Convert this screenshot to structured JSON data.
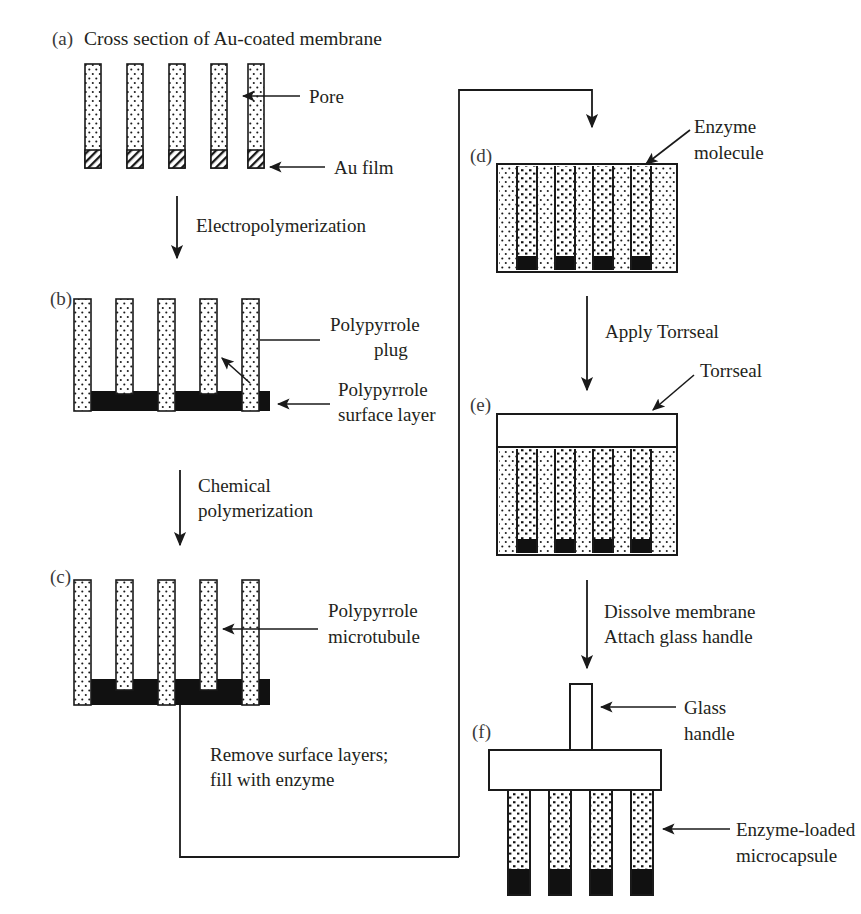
{
  "figure": {
    "title_a": "Cross section of Au-coated membrane",
    "panels": [
      {
        "id": "a",
        "label": "(a)"
      },
      {
        "id": "b",
        "label": "(b)"
      },
      {
        "id": "c",
        "label": "(c)"
      },
      {
        "id": "d",
        "label": "(d)"
      },
      {
        "id": "e",
        "label": "(e)"
      },
      {
        "id": "f",
        "label": "(f)"
      }
    ],
    "callouts": {
      "pore": "Pore",
      "au_film": "Au film",
      "polypyrrole_plug_line1": "Polypyrrole",
      "polypyrrole_plug_line2": "plug",
      "polypyrrole_surface_line1": "Polypyrrole",
      "polypyrrole_surface_line2": "surface layer",
      "polypyrrole_microtubule_line1": "Polypyrrole",
      "polypyrrole_microtubule_line2": "microtubule",
      "enzyme_molecule_line1": "Enzyme",
      "enzyme_molecule_line2": "molecule",
      "torrseal": "Torrseal",
      "glass_handle_line1": "Glass",
      "glass_handle_line2": "handle",
      "microcapsule_line1": "Enzyme-loaded",
      "microcapsule_line2": "microcapsule"
    },
    "steps": {
      "electropolymerization": "Electropolymerization",
      "chemical_line1": "Chemical",
      "chemical_line2": "polymerization",
      "remove_line1": "Remove surface layers;",
      "remove_line2": "fill with enzyme",
      "apply_torrseal": "Apply Torrseal",
      "dissolve_line1": "Dissolve membrane",
      "dissolve_line2": "Attach glass handle"
    },
    "colors": {
      "ink": "#1a1a1a",
      "stipple_fill": "#ffffff",
      "solid_black": "#111111",
      "page": "#ffffff"
    }
  }
}
